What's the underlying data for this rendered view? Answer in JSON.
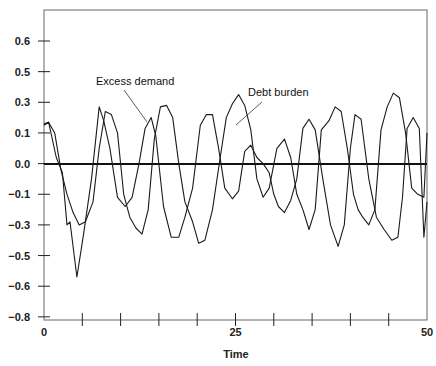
{
  "chart_data": {
    "type": "line",
    "title": "",
    "xlabel": "Time",
    "ylabel": "",
    "xlim": [
      0,
      50
    ],
    "x_tick_labels": [
      {
        "value": 0,
        "label": "0"
      },
      {
        "value": 25,
        "label": "25"
      },
      {
        "value": 50,
        "label": "50"
      }
    ],
    "x_minor_ticks": [
      5,
      10,
      15,
      20,
      25,
      30,
      35,
      40,
      45
    ],
    "y_tick_labels": [
      "0.6",
      "0.5",
      "0.3",
      "0.1",
      "0.0",
      "-0.1",
      "-0.3",
      "-0.5",
      "-0.6",
      "-0.8"
    ],
    "ylim": [
      -0.8,
      0.7
    ],
    "grid": false,
    "legend": "none (inline annotations)",
    "zero_line": true,
    "annotations": [
      {
        "text": "Excess demand",
        "series": "Excess demand"
      },
      {
        "text": "Debt burden",
        "series": "Debt burden"
      }
    ],
    "series": [
      {
        "name": "Excess demand",
        "x": [
          0,
          0.6,
          1.6,
          2.4,
          3.0,
          3.4,
          4.3,
          5.2,
          6.2,
          7.2,
          7.8,
          8.6,
          9.6,
          10.6,
          11.5,
          12.4,
          13.2,
          14.0,
          14.6,
          15.6,
          16.6,
          17.6,
          18.4,
          19.4,
          20.4,
          21.2,
          22.0,
          22.8,
          23.6,
          24.6,
          25.4,
          26.2,
          27.0,
          27.8,
          28.6,
          29.4,
          30.0,
          30.6,
          31.4,
          32.2,
          33.0,
          33.8,
          34.6,
          35.4,
          36.4,
          37.4,
          38.4,
          39.2,
          40.0,
          40.6,
          41.4,
          42.4,
          43.4,
          44.4,
          45.4,
          46.2,
          46.8,
          47.4,
          48.2,
          49.0,
          49.6,
          50.0
        ],
        "values": [
          0.15,
          0.17,
          0.02,
          -0.03,
          -0.3,
          -0.28,
          -0.57,
          -0.35,
          -0.05,
          0.27,
          0.18,
          0.05,
          -0.12,
          -0.18,
          -0.12,
          0.0,
          0.13,
          0.2,
          0.09,
          -0.18,
          -0.38,
          -0.38,
          -0.25,
          -0.08,
          0.15,
          0.22,
          0.22,
          0.05,
          -0.08,
          -0.13,
          -0.09,
          0.04,
          0.06,
          0.02,
          0.0,
          -0.03,
          -0.1,
          -0.18,
          -0.22,
          -0.14,
          -0.05,
          0.13,
          0.19,
          0.12,
          -0.05,
          -0.3,
          -0.44,
          -0.3,
          0.05,
          0.22,
          0.19,
          -0.05,
          -0.25,
          -0.33,
          -0.4,
          -0.38,
          -0.12,
          0.13,
          0.2,
          0.13,
          -0.38,
          -0.15
        ]
      },
      {
        "name": "Debt burden",
        "x": [
          0,
          0.6,
          1.4,
          2.2,
          3.0,
          3.8,
          4.6,
          5.4,
          6.4,
          7.2,
          8.0,
          8.8,
          9.6,
          10.4,
          11.2,
          12.0,
          12.8,
          13.6,
          14.4,
          15.2,
          16.0,
          16.8,
          17.6,
          18.4,
          19.4,
          20.2,
          21.0,
          22.0,
          23.0,
          23.8,
          24.6,
          25.4,
          26.2,
          27.0,
          27.8,
          28.6,
          29.4,
          30.4,
          31.4,
          32.2,
          33.0,
          33.8,
          34.6,
          35.4,
          36.2,
          37.2,
          38.0,
          38.8,
          39.6,
          40.4,
          41.0,
          41.6,
          42.4,
          43.2,
          44.0,
          44.8,
          45.6,
          46.4,
          47.2,
          48.0,
          48.8,
          49.6,
          50.0
        ],
        "values": [
          0.16,
          0.17,
          0.1,
          -0.02,
          -0.1,
          -0.22,
          -0.3,
          -0.28,
          -0.15,
          0.05,
          0.24,
          0.22,
          0.1,
          -0.1,
          -0.25,
          -0.32,
          -0.36,
          -0.2,
          0.08,
          0.27,
          0.28,
          0.2,
          0.0,
          -0.15,
          -0.28,
          -0.42,
          -0.4,
          -0.2,
          0.02,
          0.2,
          0.29,
          0.35,
          0.28,
          0.12,
          -0.05,
          -0.12,
          -0.08,
          0.05,
          0.08,
          0.02,
          -0.1,
          -0.2,
          -0.33,
          -0.2,
          0.12,
          0.18,
          0.27,
          0.24,
          0.05,
          -0.1,
          -0.2,
          -0.25,
          -0.3,
          -0.2,
          0.12,
          0.27,
          0.36,
          0.33,
          0.1,
          -0.08,
          -0.1,
          -0.12,
          0.1
        ]
      }
    ]
  }
}
